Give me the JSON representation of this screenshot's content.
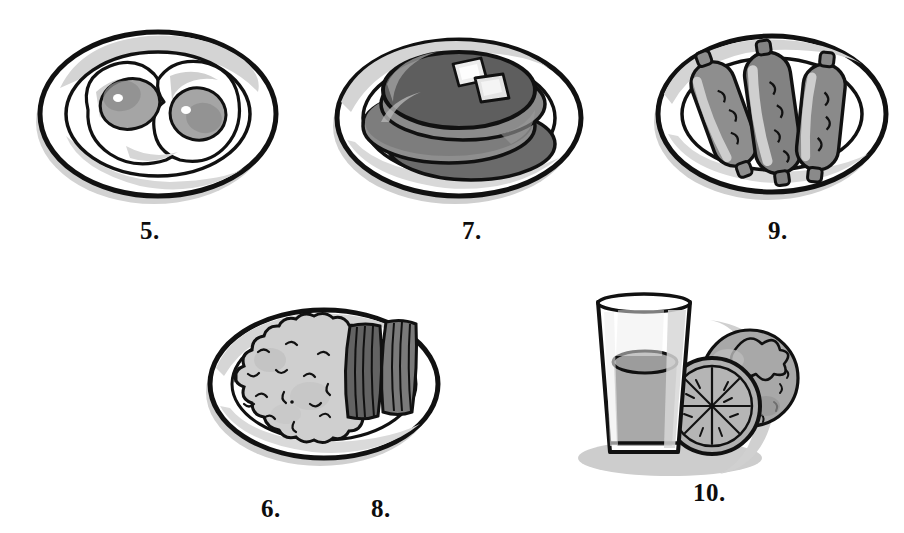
{
  "page": {
    "background_color": "#ffffff",
    "style": "grayscale hand-drawn cartoon clip-art",
    "width": 904,
    "height": 533
  },
  "palette": {
    "ink": "#111111",
    "white": "#ffffff",
    "light_gray": "#d9d9d9",
    "mid_gray": "#b3b3b3",
    "gray": "#9a9a9a",
    "dark_gray": "#6e6e6e",
    "darker_gray": "#565656",
    "shadow_gray": "#c8c8c8",
    "pale_gray": "#e6e6e6"
  },
  "items": [
    {
      "id": "fried-eggs",
      "label": "5.",
      "number": 5,
      "name": "fried eggs on a plate",
      "icon": "fried-eggs-icon",
      "label_x": 140,
      "label_y": 218,
      "art_x": 30,
      "art_y": 18,
      "art_w": 260,
      "art_h": 190
    },
    {
      "id": "pancakes",
      "label": "7.",
      "number": 7,
      "name": "stack of pancakes with butter on a plate",
      "icon": "pancakes-icon",
      "label_x": 462,
      "label_y": 218,
      "art_x": 325,
      "art_y": 18,
      "art_w": 270,
      "art_h": 190
    },
    {
      "id": "sausages",
      "label": "9.",
      "number": 9,
      "name": "three sausages on a plate",
      "icon": "sausages-icon",
      "label_x": 768,
      "label_y": 218,
      "art_x": 650,
      "art_y": 18,
      "art_w": 250,
      "art_h": 190
    },
    {
      "id": "hash-browns",
      "label": "6.",
      "number": 6,
      "name": "hash browns",
      "icon": "hash-browns-icon",
      "label_x": 261,
      "label_y": 496,
      "art_x": 0,
      "art_y": 0,
      "art_w": 0,
      "art_h": 0
    },
    {
      "id": "bacon",
      "label": "8.",
      "number": 8,
      "name": "strips of bacon",
      "icon": "bacon-icon",
      "label_x": 371,
      "label_y": 496,
      "art_x": 0,
      "art_y": 0,
      "art_w": 0,
      "art_h": 0
    },
    {
      "id": "orange-juice",
      "label": "10.",
      "number": 10,
      "name": "glass of orange juice with oranges",
      "icon": "juice-glass-icon",
      "label_x": 693,
      "label_y": 496,
      "art_x": 560,
      "art_y": 280,
      "art_w": 260,
      "art_h": 200
    }
  ],
  "combined_plate": {
    "id": "hash-browns-and-bacon-plate",
    "name": "plate with hash browns and bacon",
    "art_x": 200,
    "art_y": 296,
    "art_w": 255,
    "art_h": 182
  }
}
